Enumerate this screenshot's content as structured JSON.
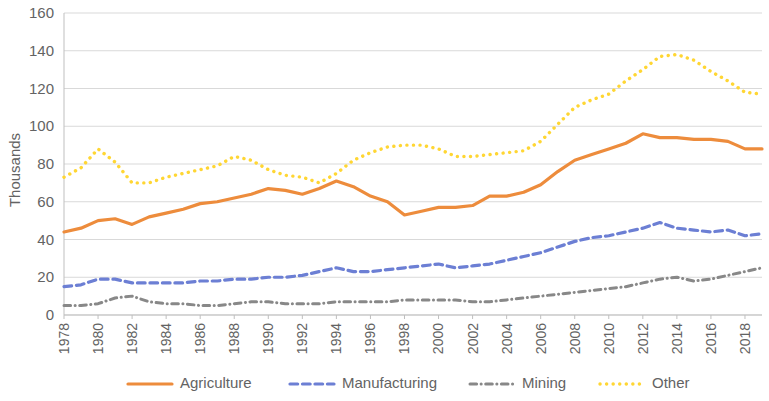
{
  "chart_data": {
    "type": "line",
    "title": "",
    "xlabel": "",
    "ylabel": "Thousands",
    "ylim": [
      0,
      160
    ],
    "ytick_step": 20,
    "yticks": [
      "0",
      "20",
      "40",
      "60",
      "80",
      "100",
      "120",
      "140",
      "160"
    ],
    "grid": true,
    "grid_axis": "y",
    "legend_position": "bottom",
    "x": [
      1978,
      1979,
      1980,
      1981,
      1982,
      1983,
      1984,
      1985,
      1986,
      1987,
      1988,
      1989,
      1990,
      1991,
      1992,
      1993,
      1994,
      1995,
      1996,
      1997,
      1998,
      1999,
      2000,
      2001,
      2002,
      2003,
      2004,
      2005,
      2006,
      2007,
      2008,
      2009,
      2010,
      2011,
      2012,
      2013,
      2014,
      2015,
      2016,
      2017,
      2018,
      2019
    ],
    "xtick_labels": [
      "1978",
      "1980",
      "1982",
      "1984",
      "1986",
      "1988",
      "1990",
      "1992",
      "1994",
      "1996",
      "1998",
      "2000",
      "2002",
      "2004",
      "2006",
      "2008",
      "2010",
      "2012",
      "2014",
      "2016",
      "2018"
    ],
    "xtick_values": [
      1978,
      1980,
      1982,
      1984,
      1986,
      1988,
      1990,
      1992,
      1994,
      1996,
      1998,
      2000,
      2002,
      2004,
      2006,
      2008,
      2010,
      2012,
      2014,
      2016,
      2018
    ],
    "xtick_rotation": 90,
    "series": [
      {
        "name": "Agriculture",
        "color": "#ED8C3C",
        "style": "solid",
        "width": 3.2,
        "values": [
          44,
          46,
          50,
          51,
          48,
          52,
          54,
          56,
          59,
          60,
          62,
          64,
          67,
          66,
          64,
          67,
          71,
          68,
          63,
          60,
          53,
          55,
          57,
          57,
          58,
          63,
          63,
          65,
          69,
          76,
          82,
          85,
          88,
          91,
          96,
          94,
          94,
          93,
          93,
          92,
          88,
          88
        ]
      },
      {
        "name": "Manufacturing",
        "color": "#6C7FD4",
        "style": "dashed",
        "width": 3.2,
        "values": [
          15,
          16,
          19,
          19,
          17,
          17,
          17,
          17,
          18,
          18,
          19,
          19,
          20,
          20,
          21,
          23,
          25,
          23,
          23,
          24,
          25,
          26,
          27,
          25,
          26,
          27,
          29,
          31,
          33,
          36,
          39,
          41,
          42,
          44,
          46,
          49,
          46,
          45,
          44,
          45,
          42,
          43
        ]
      },
      {
        "name": "Mining",
        "color": "#888888",
        "style": "dashdot",
        "width": 3.0,
        "values": [
          5,
          5,
          6,
          9,
          10,
          7,
          6,
          6,
          5,
          5,
          6,
          7,
          7,
          6,
          6,
          6,
          7,
          7,
          7,
          7,
          8,
          8,
          8,
          8,
          7,
          7,
          8,
          9,
          10,
          11,
          12,
          13,
          14,
          15,
          17,
          19,
          20,
          18,
          19,
          21,
          23,
          25
        ]
      },
      {
        "name": "Other",
        "color": "#FFD633",
        "style": "dotted",
        "width": 3.4,
        "values": [
          73,
          78,
          88,
          81,
          70,
          70,
          73,
          75,
          77,
          79,
          84,
          82,
          77,
          74,
          73,
          70,
          75,
          82,
          86,
          89,
          90,
          90,
          88,
          84,
          84,
          85,
          86,
          87,
          92,
          101,
          110,
          114,
          117,
          124,
          130,
          137,
          138,
          135,
          129,
          124,
          118,
          117
        ]
      }
    ]
  },
  "legend": {
    "items": [
      {
        "label": "Agriculture"
      },
      {
        "label": "Manufacturing"
      },
      {
        "label": "Mining"
      },
      {
        "label": "Other"
      }
    ]
  }
}
